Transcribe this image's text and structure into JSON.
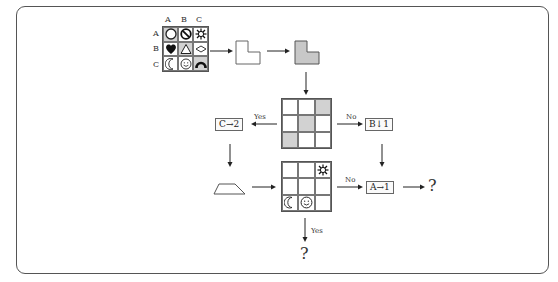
{
  "grid1": {
    "col_labels": [
      "A",
      "B",
      "C"
    ],
    "row_labels": [
      "A",
      "B",
      "C"
    ],
    "cells": [
      {
        "row": "A",
        "col": "A",
        "icon": "circle-icon",
        "shaded": true
      },
      {
        "row": "A",
        "col": "B",
        "icon": "no-sign-icon",
        "shaded": false
      },
      {
        "row": "A",
        "col": "C",
        "icon": "sun-icon",
        "shaded": false
      },
      {
        "row": "B",
        "col": "A",
        "icon": "heart-icon",
        "shaded": false
      },
      {
        "row": "B",
        "col": "B",
        "icon": "triangle-icon",
        "shaded": true
      },
      {
        "row": "B",
        "col": "C",
        "icon": "diamond-icon",
        "shaded": false
      },
      {
        "row": "C",
        "col": "A",
        "icon": "crescent-moon-icon",
        "shaded": false
      },
      {
        "row": "C",
        "col": "B",
        "icon": "smiley-icon",
        "shaded": false
      },
      {
        "row": "C",
        "col": "C",
        "icon": "arch-icon",
        "shaded": true
      }
    ]
  },
  "shapes": {
    "l_shape_outline": "l-shape-outline",
    "l_shape_filled": "l-shape-filled",
    "trapezoid": "trapezoid"
  },
  "grid2": {
    "shaded_cells": [
      [
        0,
        2
      ],
      [
        1,
        1
      ],
      [
        2,
        0
      ]
    ]
  },
  "grid3": {
    "cells": [
      {
        "r": 0,
        "c": 2,
        "icon": "sun-icon"
      },
      {
        "r": 2,
        "c": 0,
        "icon": "crescent-moon-icon"
      },
      {
        "r": 2,
        "c": 1,
        "icon": "smiley-icon"
      }
    ]
  },
  "labels": {
    "yes_left": "Yes",
    "no_right": "No",
    "no_grid3": "No",
    "yes_down": "Yes"
  },
  "boxes": {
    "c_to_2": "C→2",
    "b_down_1": "B↓1",
    "a_to_1": "A→1"
  },
  "questions": {
    "right": "?",
    "bottom": "?"
  },
  "colors": {
    "shade": "#d2d2d2",
    "line": "#555555"
  }
}
